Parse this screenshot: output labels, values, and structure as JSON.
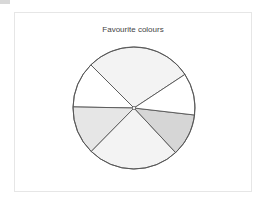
{
  "chart_data": {
    "type": "pie",
    "title": "Favourite colours",
    "categories": [
      "Slice 1",
      "Slice 2",
      "Slice 3",
      "Slice 4",
      "Slice 5",
      "Slice 6"
    ],
    "values": [
      28.2,
      12.2,
      12.9,
      24.3,
      11.2,
      11.1
    ],
    "colors": [
      "#f3f3f3",
      "#ffffff",
      "#e6e6e6",
      "#f3f3f3",
      "#d6d6d6",
      "#ffffff"
    ],
    "start_angle_deg": 33.4,
    "direction": "counterclockwise",
    "legend": "none",
    "labels_shown": false
  },
  "style": {
    "stroke": "#555555",
    "frame_border": "#e6e6e6"
  }
}
